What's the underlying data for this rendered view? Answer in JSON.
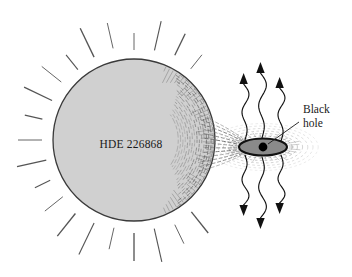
{
  "figure": {
    "type": "astronomy-diagram",
    "background_color": "#ffffff"
  },
  "star": {
    "name": "HDE 226868",
    "label": "HDE 226868",
    "label_x": 131,
    "label_y": 148,
    "center_x": 134,
    "center_y": 140,
    "radius_x": 81,
    "radius_y": 82,
    "fill_color": "#d0d0d0",
    "outline_color": "#3a3a3a",
    "shading_color": "#5a5a5a",
    "ray_color": "#555555",
    "ray_count": 28
  },
  "black_hole": {
    "label_line_1": "Black",
    "label_line_2": "hole",
    "label_x": 303,
    "label_y": 113,
    "point_x": 263,
    "point_y": 147,
    "point_radius": 4.4,
    "point_color": "#000000",
    "leader_from_x": 299,
    "leader_from_y": 122,
    "leader_to_x": 268,
    "leader_to_y": 144
  },
  "accretion_disk": {
    "center_x": 263,
    "center_y": 147,
    "radius_x": 24,
    "radius_y": 8.5,
    "fill_color": "#8a8a8a",
    "outline_color": "#111111",
    "halo_color": "#777777",
    "halo_ring_count": 6
  },
  "gas_stream": {
    "from_star_edge_x": 206,
    "from_star_edge_y": 143,
    "to_disk_x": 246,
    "to_disk_y": 147,
    "line_color": "#6a6a6a",
    "strand_count": 13
  },
  "xray_emission": {
    "color": "#111111",
    "arrows_up": [
      {
        "x": 245,
        "base_y": 140,
        "tip_y": 73,
        "sway": 4.5
      },
      {
        "x": 262,
        "base_y": 138,
        "tip_y": 62,
        "sway": 5.0
      },
      {
        "x": 281,
        "base_y": 141,
        "tip_y": 77,
        "sway": 4.5
      }
    ],
    "arrows_down": [
      {
        "x": 245,
        "base_y": 155,
        "tip_y": 216,
        "sway": 4.5
      },
      {
        "x": 262,
        "base_y": 157,
        "tip_y": 229,
        "sway": 5.0
      },
      {
        "x": 281,
        "base_y": 155,
        "tip_y": 214,
        "sway": 4.5
      }
    ]
  }
}
